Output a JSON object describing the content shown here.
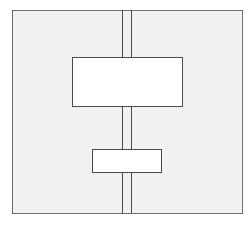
{
  "diagram": {
    "type": "schematic",
    "frame": {
      "label": "",
      "fill": "#f1f1f1",
      "stroke": "#6e6e6e"
    },
    "shaft": {
      "label": "",
      "stroke": "#4a4a4a",
      "line_count": 2
    },
    "blocks": [
      {
        "id": "upper-block",
        "label": "",
        "fill": "#ffffff"
      },
      {
        "id": "lower-block",
        "label": "",
        "fill": "#ffffff"
      }
    ]
  }
}
